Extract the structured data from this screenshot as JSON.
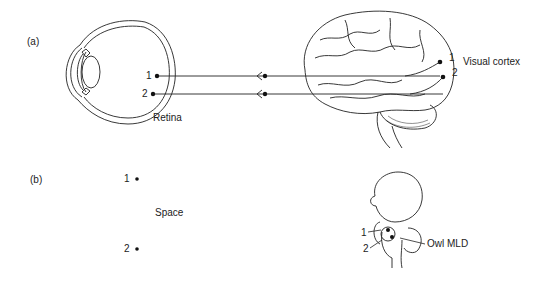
{
  "panel_a": {
    "label": "(a)",
    "retina_label": "Retina",
    "cortex_label": "Visual cortex",
    "points": [
      {
        "id": "1",
        "retina": "1",
        "cortex": "1"
      },
      {
        "id": "2",
        "retina": "2",
        "cortex": "2"
      }
    ]
  },
  "panel_b": {
    "label": "(b)",
    "space_label": "Space",
    "mld_label": "Owl MLD",
    "points": [
      {
        "id": "1",
        "space": "1",
        "mld": "1"
      },
      {
        "id": "2",
        "space": "2",
        "mld": "2"
      }
    ]
  },
  "colors": {
    "ink": "#222222",
    "background": "#ffffff"
  }
}
